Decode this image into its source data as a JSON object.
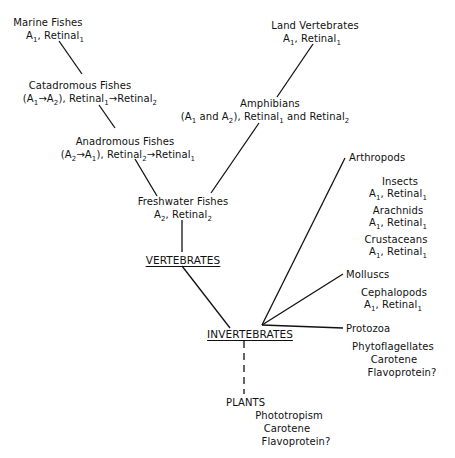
{
  "nodes": {
    "marine_fishes": {
      "name": "Marine Fishes",
      "pigment": [
        "A",
        "1",
        ", Retinal",
        "1"
      ]
    },
    "catadromous_fishes": {
      "name": "Catadromous Fishes",
      "pigment_text": "(A1→A2), Retinal1→Retinal2"
    },
    "anadromous_fishes": {
      "name": "Anadromous Fishes",
      "pigment_text": "(A2→A1), Retinal2→Retinal1"
    },
    "freshwater_fishes": {
      "name": "Freshwater Fishes",
      "pigment_text": "A2, Retinal2"
    },
    "land_vertebrates": {
      "name": "Land Vertebrates",
      "pigment_text": "A1, Retinal1"
    },
    "amphibians": {
      "name": "Amphibians",
      "pigment_text": "(A1 and A2), Retinal1 and Retinal2"
    },
    "vertebrates": {
      "name": "VERTEBRATES"
    },
    "invertebrates": {
      "name": "INVERTEBRATES"
    },
    "arthropods": {
      "name": "Arthropods"
    },
    "insects": {
      "name": "Insects",
      "pigment_text": "A1, Retinal1"
    },
    "arachnids": {
      "name": "Arachnids",
      "pigment_text": "A1, Retinal1"
    },
    "crustaceans": {
      "name": "Crustaceans",
      "pigment_text": "A1, Retinal1"
    },
    "molluscs": {
      "name": "Molluscs"
    },
    "cephalopods": {
      "name": "Cephalopods",
      "pigment_text": "A1, Retinal1"
    },
    "protozoa": {
      "name": "Protozoa"
    },
    "phytoflagellates": {
      "name": "Phytoflagellates",
      "line2": "Carotene",
      "line3": "Flavoprotein?"
    },
    "plants": {
      "name": "PLANTS",
      "line2": "Phototropism",
      "line3": "Carotene",
      "line4": "Flavoprotein?"
    }
  },
  "sub": {
    "one": "1",
    "two": "2"
  },
  "text": {
    "A": "A",
    "retinal": "Retinal",
    "comma_retinal": ", Retinal",
    "arrow": "→",
    "and": " and ",
    "open_paren": "(",
    "close_paren_comma": "), Retinal"
  },
  "edges": [
    [
      "marine_fishes",
      "catadromous_fishes",
      "solid"
    ],
    [
      "catadromous_fishes",
      "anadromous_fishes",
      "solid"
    ],
    [
      "anadromous_fishes",
      "freshwater_fishes",
      "solid"
    ],
    [
      "land_vertebrates",
      "amphibians",
      "solid"
    ],
    [
      "amphibians",
      "freshwater_fishes",
      "solid"
    ],
    [
      "freshwater_fishes",
      "vertebrates",
      "solid"
    ],
    [
      "vertebrates",
      "invertebrates",
      "solid"
    ],
    [
      "invertebrates",
      "arthropods",
      "solid"
    ],
    [
      "invertebrates",
      "molluscs",
      "solid"
    ],
    [
      "invertebrates",
      "protozoa",
      "solid"
    ],
    [
      "invertebrates",
      "plants",
      "dashed"
    ]
  ]
}
